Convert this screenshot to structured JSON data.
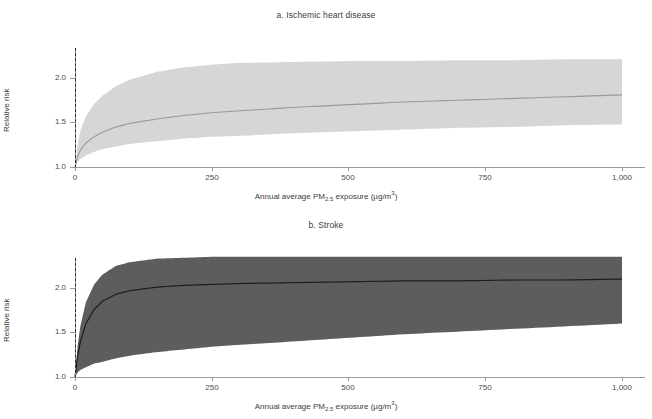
{
  "figure": {
    "x_axis_label_prefix": "Annual average PM",
    "x_axis_label_sub": "2.5",
    "x_axis_label_suffix": " exposure (µg/m",
    "x_axis_label_sup": "3",
    "x_axis_label_end": ")",
    "y_axis_label": "Relative risk",
    "colors": {
      "band_a": "#d6d6d6",
      "line_a": "#9a9a9a",
      "band_b": "#5d5d5d",
      "line_b": "#1d1d1d",
      "axis": "#9a9a9a",
      "dashed_reference": "#2b2b2b",
      "text": "#3d3d3d",
      "background": "#ffffff"
    }
  },
  "panels": [
    {
      "id": "a",
      "title": "a. Ischemic heart disease"
    },
    {
      "id": "b",
      "title": "b. Stroke"
    }
  ],
  "chart_data": [
    {
      "type": "line",
      "title": "a. Ischemic heart disease",
      "xlabel": "Annual average PM2.5 exposure (µg/m3)",
      "ylabel": "Relative risk",
      "xlim": [
        0,
        1000
      ],
      "ylim": [
        0.95,
        2.32
      ],
      "xticks": [
        0,
        250,
        500,
        750,
        1000
      ],
      "xticklabels": [
        "0",
        "250",
        "500",
        "750",
        "1,000"
      ],
      "yticks": [
        1.0,
        1.5,
        2.0
      ],
      "yticklabels": [
        "1.0",
        "1.5",
        "2.0"
      ],
      "grid": false,
      "legend": "none",
      "annotations": [
        {
          "type": "vline",
          "x": 0,
          "style": "dashed",
          "label": "counterfactual reference"
        }
      ],
      "x": [
        0,
        5,
        10,
        20,
        35,
        50,
        75,
        100,
        150,
        200,
        250,
        300,
        400,
        500,
        600,
        700,
        800,
        900,
        1000
      ],
      "series": [
        {
          "name": "Mean relative risk",
          "values": [
            1.0,
            1.12,
            1.19,
            1.27,
            1.34,
            1.39,
            1.45,
            1.49,
            1.54,
            1.58,
            1.61,
            1.63,
            1.67,
            1.7,
            1.73,
            1.75,
            1.77,
            1.79,
            1.81
          ]
        },
        {
          "name": "95% uncertainty interval upper",
          "values": [
            1.0,
            1.27,
            1.41,
            1.57,
            1.71,
            1.8,
            1.91,
            1.98,
            2.07,
            2.12,
            2.15,
            2.17,
            2.18,
            2.19,
            2.19,
            2.2,
            2.2,
            2.21,
            2.21
          ]
        },
        {
          "name": "95% uncertainty interval lower",
          "values": [
            1.0,
            1.06,
            1.09,
            1.13,
            1.17,
            1.2,
            1.23,
            1.26,
            1.29,
            1.32,
            1.34,
            1.35,
            1.38,
            1.4,
            1.42,
            1.44,
            1.45,
            1.47,
            1.48
          ]
        }
      ]
    },
    {
      "type": "line",
      "title": "b. Stroke",
      "xlabel": "Annual average PM2.5 exposure (µg/m3)",
      "ylabel": "Relative risk",
      "xlim": [
        0,
        1000
      ],
      "ylim": [
        0.95,
        2.32
      ],
      "xticks": [
        0,
        250,
        500,
        750,
        1000
      ],
      "xticklabels": [
        "0",
        "250",
        "500",
        "750",
        "1,000"
      ],
      "yticks": [
        1.0,
        1.5,
        2.0
      ],
      "yticklabels": [
        "1.0",
        "1.5",
        "2.0"
      ],
      "grid": false,
      "legend": "none",
      "annotations": [
        {
          "type": "vline",
          "x": 0,
          "style": "dashed",
          "label": "counterfactual reference"
        }
      ],
      "x": [
        0,
        5,
        10,
        20,
        35,
        50,
        75,
        100,
        150,
        200,
        250,
        300,
        400,
        500,
        600,
        700,
        800,
        900,
        1000
      ],
      "series": [
        {
          "name": "Mean relative risk",
          "values": [
            1.0,
            1.24,
            1.4,
            1.6,
            1.76,
            1.85,
            1.93,
            1.97,
            2.01,
            2.03,
            2.04,
            2.05,
            2.06,
            2.07,
            2.08,
            2.08,
            2.09,
            2.09,
            2.1
          ]
        },
        {
          "name": "95% uncertainty interval upper",
          "values": [
            1.0,
            1.36,
            1.58,
            1.84,
            2.04,
            2.15,
            2.25,
            2.29,
            2.33,
            2.34,
            2.35,
            2.35,
            2.35,
            2.35,
            2.35,
            2.35,
            2.35,
            2.35,
            2.35
          ]
        },
        {
          "name": "95% uncertainty interval lower",
          "values": [
            1.0,
            1.05,
            1.08,
            1.11,
            1.15,
            1.17,
            1.21,
            1.24,
            1.28,
            1.31,
            1.34,
            1.36,
            1.4,
            1.44,
            1.48,
            1.51,
            1.54,
            1.57,
            1.6
          ]
        }
      ]
    }
  ]
}
